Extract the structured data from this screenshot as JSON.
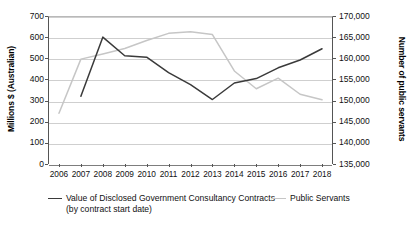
{
  "chart_data": {
    "type": "line",
    "title": "",
    "xlabel": "",
    "categories": [
      2006,
      2007,
      2008,
      2009,
      2010,
      2011,
      2012,
      2013,
      2014,
      2015,
      2016,
      2017,
      2018
    ],
    "series": [
      {
        "name": "Value of Disclosed Government Consultancy Contracts (by contract start date)",
        "axis": "left",
        "color": "#3a3a3a",
        "unit": "Millions $ (Australian)",
        "x": [
          2007,
          2008,
          2009,
          2010,
          2011,
          2012,
          2013,
          2014,
          2015,
          2016,
          2017,
          2018
        ],
        "values": [
          320,
          600,
          512,
          505,
          432,
          375,
          305,
          383,
          404,
          455,
          492,
          545
        ]
      },
      {
        "name": "Public Servants",
        "axis": "right",
        "color": "#c6c6c6",
        "unit": "Number of public servants",
        "x": [
          2006,
          2007,
          2008,
          2009,
          2010,
          2011,
          2012,
          2013,
          2014,
          2015,
          2016,
          2017,
          2018
        ],
        "values": [
          147000,
          159800,
          161000,
          162300,
          164200,
          165900,
          166300,
          165600,
          157000,
          152800,
          155300,
          151500,
          150200
        ]
      }
    ],
    "axes": {
      "left": {
        "label": "Millions $ (Australian)",
        "ticks": [
          "700",
          "600",
          "500",
          "400",
          "300",
          "200",
          "100",
          "0"
        ],
        "min": 0,
        "max": 700,
        "step": 100
      },
      "right": {
        "label": "Number of public servants",
        "ticks": [
          "170,000",
          "165,000",
          "160,000",
          "155,000",
          "150,000",
          "145,000",
          "140,000",
          "135,000"
        ],
        "min": 135000,
        "max": 170000,
        "step": 5000
      },
      "x": {
        "ticks": [
          "2006",
          "2007",
          "2008",
          "2009",
          "2010",
          "2011",
          "2012",
          "2013",
          "2014",
          "2015",
          "2016",
          "2017",
          "2018"
        ]
      }
    },
    "grid": true,
    "legend_position": "bottom",
    "legend": [
      {
        "label": "Value of Disclosed Government Consultancy Contracts (by contract start date)",
        "color": "#3a3a3a"
      },
      {
        "label": "Public Servants",
        "color": "#c6c6c6"
      }
    ]
  }
}
